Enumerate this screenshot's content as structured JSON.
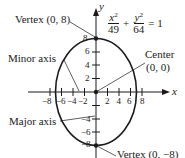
{
  "diagram": {
    "equation": {
      "x_num": "x",
      "x_exp": "2",
      "x_den": "49",
      "plus": "+",
      "y_num": "y",
      "y_exp": "2",
      "y_den": "64",
      "equals": "= 1"
    },
    "axes": {
      "x_label": "x",
      "y_label": "y",
      "x_ticks": [
        "−8",
        "−6",
        "−4",
        "−2",
        "2",
        "4",
        "6",
        "8"
      ],
      "y_ticks": [
        "8",
        "6",
        "4",
        "2",
        "−4",
        "−6",
        "−8"
      ]
    },
    "labels": {
      "vertex_top": "Vertex (0, 8)",
      "minor_axis": "Minor axis",
      "center_line1": "Center",
      "center_line2": "(0, 0)",
      "major_axis": "Major axis",
      "vertex_bottom": "Vertex (0, −8)"
    },
    "colors": {
      "stroke": "#1a1a1a",
      "background": "#ffffff"
    }
  }
}
